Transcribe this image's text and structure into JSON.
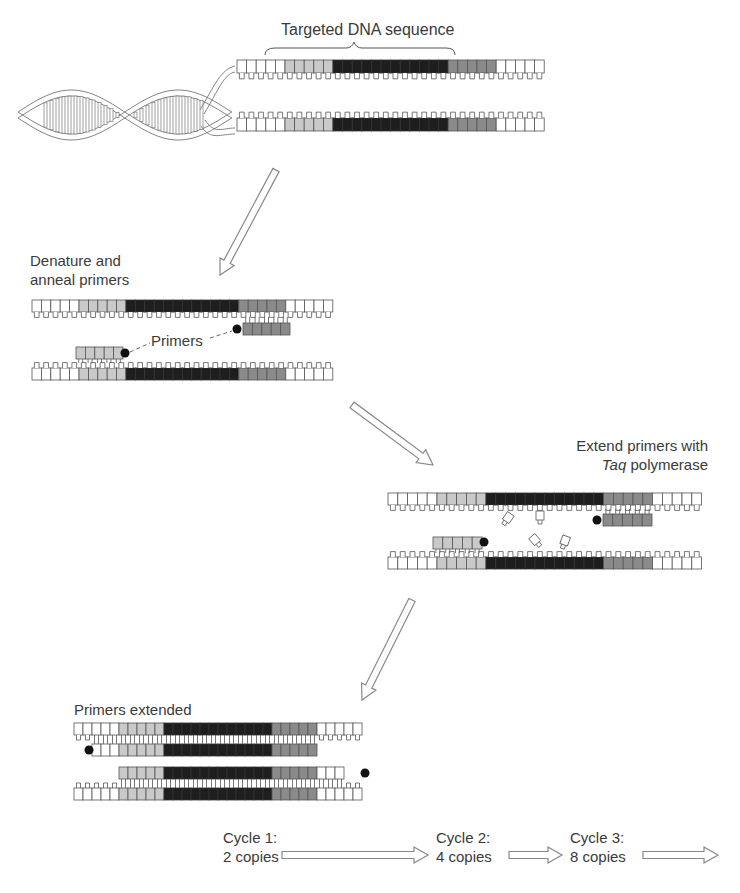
{
  "colors": {
    "white_base": "#ffffff",
    "light_region": "#c9c9c9",
    "dark_region": "#1e1e1e",
    "mid_region": "#8a8a8a",
    "outline": "#555555",
    "arrow": "#888888",
    "primer_dot": "#111111"
  },
  "step0": {
    "label": "Targeted DNA sequence",
    "strand_layout": "5 white, 5 light, 12 dark, 5 mid, 5 white"
  },
  "step1": {
    "line1": "Denature and",
    "line2": "anneal primers",
    "primers_label": "Primers"
  },
  "step2": {
    "line1": "Extend primers with",
    "line2_italic": "Taq",
    "line2_rest": " polymerase"
  },
  "step3": {
    "label": "Primers extended"
  },
  "cycles": [
    {
      "line1": "Cycle 1:",
      "line2": "2 copies"
    },
    {
      "line1": "Cycle 2:",
      "line2": "4 copies"
    },
    {
      "line1": "Cycle 3:",
      "line2": "8 copies"
    }
  ]
}
